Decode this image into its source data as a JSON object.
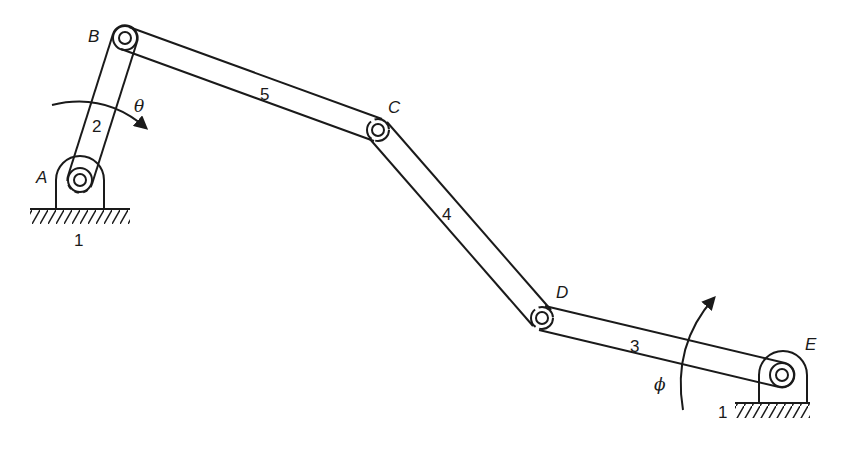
{
  "figure": {
    "type": "four-bar-style mechanism (five links incl. ground)",
    "joints": [
      {
        "id": "A",
        "label": "A",
        "x": 80,
        "y": 180,
        "kind": "ground-pivot"
      },
      {
        "id": "B",
        "label": "B",
        "x": 125,
        "y": 38,
        "kind": "pin"
      },
      {
        "id": "C",
        "label": "C",
        "x": 378,
        "y": 130,
        "kind": "pin"
      },
      {
        "id": "D",
        "label": "D",
        "x": 542,
        "y": 318,
        "kind": "pin"
      },
      {
        "id": "E",
        "label": "E",
        "x": 782,
        "y": 375,
        "kind": "ground-pivot"
      }
    ],
    "links": [
      {
        "number": "2",
        "from": "A",
        "to": "B"
      },
      {
        "number": "5",
        "from": "B",
        "to": "C"
      },
      {
        "number": "4",
        "from": "C",
        "to": "D"
      },
      {
        "number": "3",
        "from": "D",
        "to": "E"
      }
    ],
    "ground_labels": [
      "1",
      "1"
    ],
    "angles": [
      {
        "symbol": "θ",
        "at": "A",
        "direction": "clockwise"
      },
      {
        "symbol": "ϕ",
        "at": "E",
        "direction": "counter-clockwise"
      }
    ]
  },
  "labels": {
    "A": "A",
    "B": "B",
    "C": "C",
    "D": "D",
    "E": "E",
    "link2": "2",
    "link3": "3",
    "link4": "4",
    "link5": "5",
    "ground_left": "1",
    "ground_right": "1",
    "theta": "θ",
    "phi": "ϕ"
  },
  "colors": {
    "ink": "#1a1a1a",
    "background": "#ffffff"
  }
}
